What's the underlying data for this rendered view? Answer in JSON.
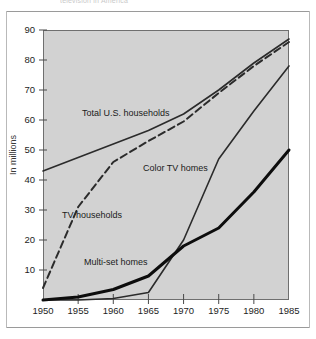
{
  "figure": {
    "clipped_caption": "television in America",
    "frame_color": "#6f6f6f",
    "plot_background": "#d2d2d2",
    "page_background": "#ffffff"
  },
  "chart_data": {
    "type": "line",
    "title": "",
    "xlabel": "",
    "ylabel": "In millions",
    "xlim": [
      1950,
      1985
    ],
    "ylim": [
      0,
      90
    ],
    "xticks": [
      "1950",
      "1955",
      "1960",
      "1965",
      "1970",
      "1975",
      "1980",
      "1985"
    ],
    "yticks": [
      "10",
      "20",
      "30",
      "40",
      "50",
      "60",
      "70",
      "80",
      "90"
    ],
    "grid": false,
    "legend_position": "inline-annotations",
    "x": [
      1950,
      1955,
      1960,
      1965,
      1970,
      1975,
      1980,
      1985
    ],
    "series": [
      {
        "name": "Total U.S. households",
        "label": "Total U.S. households",
        "style": "solid",
        "width": 1.6,
        "color": "#2b2b2b",
        "values": [
          43,
          47.5,
          52,
          56.5,
          62,
          70,
          79,
          87
        ]
      },
      {
        "name": "TV households",
        "label": "TV households",
        "style": "dashed",
        "width": 2.0,
        "color": "#2b2b2b",
        "values": [
          4,
          31,
          46,
          53,
          59.5,
          69,
          78,
          86
        ]
      },
      {
        "name": "Color TV homes",
        "label": "Color TV homes",
        "style": "solid",
        "width": 1.6,
        "color": "#2b2b2b",
        "values": [
          0,
          0,
          0.5,
          2.5,
          20,
          47,
          63,
          78
        ]
      },
      {
        "name": "Multi-set homes",
        "label": "Multi-set homes",
        "style": "solid-thick",
        "width": 3.0,
        "color": "#0d0d0d",
        "values": [
          0,
          1,
          3.5,
          8,
          18,
          24,
          36,
          50
        ]
      }
    ]
  }
}
